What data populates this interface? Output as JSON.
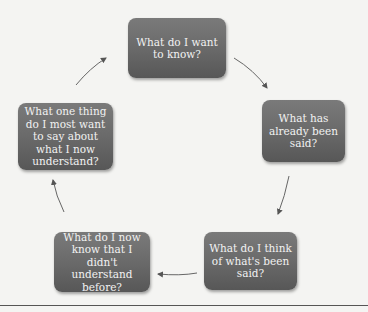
{
  "diagram": {
    "type": "cycle",
    "nodes": [
      {
        "id": "want-to-know",
        "label": "What do I want to know?"
      },
      {
        "id": "already-said",
        "label": "What has already been said?"
      },
      {
        "id": "think-of",
        "label": "What do I think of what's been said?"
      },
      {
        "id": "now-know",
        "label": "What do I now know that I didn't understand before?"
      },
      {
        "id": "one-thing",
        "label": "What one thing do I most want to say about what I now understand?"
      }
    ],
    "edges": [
      {
        "from": "want-to-know",
        "to": "already-said"
      },
      {
        "from": "already-said",
        "to": "think-of"
      },
      {
        "from": "think-of",
        "to": "now-know"
      },
      {
        "from": "now-know",
        "to": "one-thing"
      },
      {
        "from": "one-thing",
        "to": "want-to-know"
      }
    ],
    "colors": {
      "node_fill": "#6a6a6a",
      "node_text": "#f2f2f2",
      "arrow": "#555555",
      "background": "#f4f4f2"
    }
  }
}
